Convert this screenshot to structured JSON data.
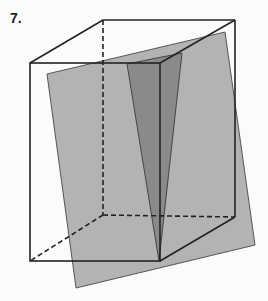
{
  "problem": {
    "number_label": "7."
  },
  "figure": {
    "colors": {
      "background": "#fbfbfb",
      "edge": "#222222",
      "plane": "#b3b3b3",
      "section": "#8a8a8a"
    },
    "cube": {
      "front_top_left": [
        30,
        63
      ],
      "front_top_right": [
        160,
        63
      ],
      "front_bottom_left": [
        30,
        261
      ],
      "front_bottom_right": [
        160,
        261
      ],
      "back_top_left": [
        103,
        20
      ],
      "back_top_right": [
        235,
        20
      ],
      "back_bottom_left": [
        103,
        215
      ],
      "back_bottom_right": [
        235,
        217
      ]
    },
    "plane": [
      [
        47,
        74
      ],
      [
        225,
        32
      ],
      [
        255,
        245
      ],
      [
        76,
        288
      ]
    ],
    "section_triangle": [
      [
        127,
        64
      ],
      [
        182,
        53
      ],
      [
        159,
        261
      ]
    ]
  }
}
